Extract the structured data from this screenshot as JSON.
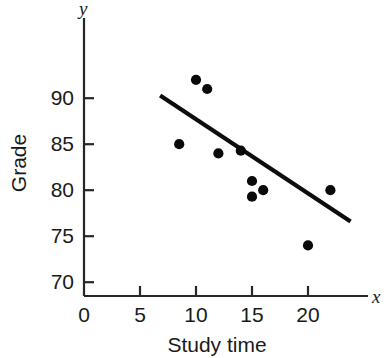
{
  "chart_data": {
    "type": "scatter",
    "title": "",
    "xlabel": "Study time",
    "ylabel": "Grade",
    "x_axis_letter": "x",
    "y_axis_letter": "y",
    "xlim": [
      0,
      24
    ],
    "ylim": [
      68.5,
      93.5
    ],
    "grid": false,
    "legend": null,
    "x_ticks": [
      0,
      5,
      10,
      15,
      20
    ],
    "x_tick_labels": [
      "0",
      "5",
      "10",
      "15",
      "20"
    ],
    "y_ticks": [
      70,
      75,
      80,
      85,
      90
    ],
    "y_tick_labels": [
      "70",
      "75",
      "80",
      "85",
      "90"
    ],
    "points": [
      {
        "x": 8.5,
        "y": 85.0
      },
      {
        "x": 10.0,
        "y": 92.0
      },
      {
        "x": 11.0,
        "y": 91.0
      },
      {
        "x": 12.0,
        "y": 84.0
      },
      {
        "x": 14.0,
        "y": 84.3
      },
      {
        "x": 15.0,
        "y": 81.0
      },
      {
        "x": 15.0,
        "y": 79.3
      },
      {
        "x": 16.0,
        "y": 80.0
      },
      {
        "x": 20.0,
        "y": 74.0
      },
      {
        "x": 22.0,
        "y": 80.0
      }
    ],
    "trend_line": {
      "x1": 6.8,
      "y1": 90.3,
      "x2": 23.8,
      "y2": 76.6
    },
    "colors": {
      "point": "#0a0a0a",
      "line": "#0d0d0d",
      "axis": "#262626",
      "text": "#1a1a1a",
      "background": "#ffffff"
    }
  }
}
